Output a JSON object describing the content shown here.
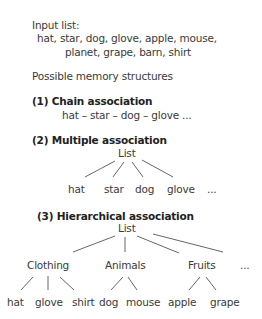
{
  "input": {
    "label": "Input list:",
    "line1": "hat, star, dog, glove, apple, mouse,",
    "line2": "planet, grape, barn, shirt"
  },
  "structures_heading": "Possible memory structures",
  "chain": {
    "title": "(1) Chain association",
    "sequence": "hat – star – dog – glove ..."
  },
  "multiple": {
    "title": "(2) Multiple association",
    "root": "List",
    "children": [
      "hat",
      "star",
      "dog",
      "glove",
      "..."
    ]
  },
  "hierarchical": {
    "title": "(3) Hierarchical association",
    "root": "List",
    "categories": [
      {
        "label": "Clothing",
        "items": [
          "hat",
          "glove",
          "shirt"
        ]
      },
      {
        "label": "Animals",
        "items": [
          "dog",
          "mouse"
        ]
      },
      {
        "label": "Fruits",
        "items": [
          "apple",
          "grape"
        ]
      },
      {
        "label": "...",
        "items": []
      }
    ]
  }
}
